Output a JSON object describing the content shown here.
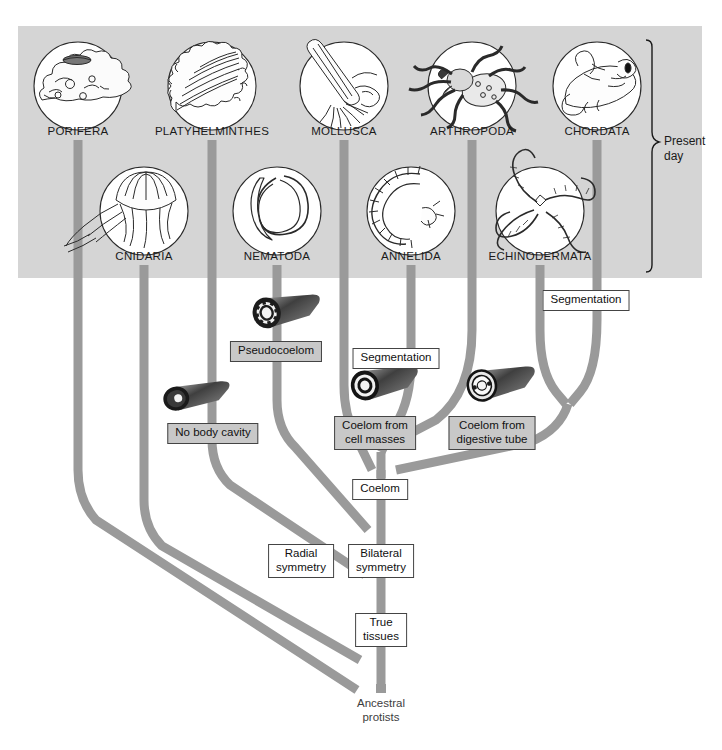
{
  "figure": {
    "kind": "phylogenetic-tree",
    "root_label": "Ancestral\nprotists",
    "root_line1": "Ancestral",
    "root_line2": "protists",
    "era_label_line1": "Present",
    "era_label_line2": "day",
    "colors": {
      "panel_background": "#d5d5d5",
      "branch": "#9a9a9a",
      "branch_dark": "#8e8e8e",
      "label_text": "#111111",
      "box_border": "#444444",
      "box_grey_fill": "#c8c8c8",
      "box_white_fill": "#ffffff",
      "organism_outline": "#2a2a2a",
      "page_background": "#ffffff"
    }
  },
  "taxa": [
    {
      "id": "porifera",
      "label": "PORIFERA",
      "row": 1,
      "label_x": 78,
      "label_y": 131,
      "icon": "sponge-icon"
    },
    {
      "id": "platyhelminthes",
      "label": "PLATYHELMINTHES",
      "row": 1,
      "label_x": 212,
      "label_y": 131,
      "icon": "flatworm-icon"
    },
    {
      "id": "mollusca",
      "label": "MOLLUSCA",
      "row": 1,
      "label_x": 344,
      "label_y": 131,
      "icon": "squid-icon"
    },
    {
      "id": "arthropoda",
      "label": "ARTHROPODA",
      "row": 1,
      "label_x": 472,
      "label_y": 131,
      "icon": "spider-icon"
    },
    {
      "id": "chordata",
      "label": "CHORDATA",
      "row": 1,
      "label_x": 597,
      "label_y": 131,
      "icon": "frog-icon"
    },
    {
      "id": "cnidaria",
      "label": "CNIDARIA",
      "row": 2,
      "label_x": 144,
      "label_y": 256,
      "icon": "jellyfish-icon"
    },
    {
      "id": "nematoda",
      "label": "NEMATODA",
      "row": 2,
      "label_x": 277,
      "label_y": 256,
      "icon": "roundworm-icon"
    },
    {
      "id": "annelida",
      "label": "ANNELIDA",
      "row": 2,
      "label_x": 411,
      "label_y": 256,
      "icon": "segmented-worm-icon"
    },
    {
      "id": "echinodermata",
      "label": "ECHINODERMATA",
      "row": 2,
      "label_x": 540,
      "label_y": 256,
      "icon": "brittle-star-icon"
    }
  ],
  "traits": [
    {
      "id": "pseudocoelom",
      "label": "Pseudocoelom",
      "x": 276,
      "y": 348,
      "fill": "grey",
      "lines": [
        "Pseudocoelom"
      ]
    },
    {
      "id": "segmentation-right",
      "label": "Segmentation",
      "x": 586,
      "y": 297,
      "fill": "white",
      "lines": [
        "Segmentation"
      ]
    },
    {
      "id": "segmentation-protostome",
      "label": "Segmentation",
      "x": 396,
      "y": 355,
      "fill": "white",
      "lines": [
        "Segmentation"
      ]
    },
    {
      "id": "no-body-cavity",
      "label": "No body cavity",
      "x": 213,
      "y": 430,
      "fill": "grey",
      "lines": [
        "No body cavity"
      ]
    },
    {
      "id": "coelom-cell-masses",
      "label": "Coelom from cell masses",
      "x": 375,
      "y": 423,
      "fill": "grey",
      "lines": [
        "Coelom from",
        "cell masses"
      ]
    },
    {
      "id": "coelom-digestive-tube",
      "label": "Coelom from digestive tube",
      "x": 492,
      "y": 423,
      "fill": "grey",
      "lines": [
        "Coelom from",
        "digestive tube"
      ]
    },
    {
      "id": "coelom",
      "label": "Coelom",
      "x": 380,
      "y": 486,
      "fill": "white",
      "lines": [
        "Coelom"
      ]
    },
    {
      "id": "radial-symmetry",
      "label": "Radial symmetry",
      "x": 301,
      "y": 551,
      "fill": "white",
      "lines": [
        "Radial",
        "symmetry"
      ]
    },
    {
      "id": "bilateral-symmetry",
      "label": "Bilateral symmetry",
      "x": 381,
      "y": 551,
      "fill": "white",
      "lines": [
        "Bilateral",
        "symmetry"
      ]
    },
    {
      "id": "true-tissues",
      "label": "True tissues",
      "x": 381,
      "y": 620,
      "fill": "white",
      "lines": [
        "True",
        "tissues"
      ]
    }
  ],
  "root": {
    "x": 381,
    "y": 702,
    "line1": "Ancestral",
    "line2": "protists"
  },
  "era_bracket": {
    "x": 652,
    "top_y": 40,
    "bottom_y": 272,
    "label_x": 664,
    "label_y": 142
  }
}
